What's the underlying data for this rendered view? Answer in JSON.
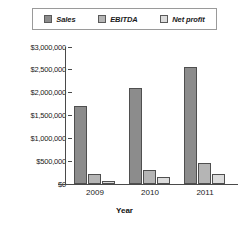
{
  "chart_data": {
    "type": "bar",
    "title": "",
    "xlabel": "Year",
    "ylabel": "",
    "categories": [
      "2009",
      "2010",
      "2011"
    ],
    "series": [
      {
        "name": "Sales",
        "values": [
          1700000,
          2100000,
          2570000
        ],
        "color": "#8c8c8c"
      },
      {
        "name": "EBITDA",
        "values": [
          210000,
          300000,
          450000
        ],
        "color": "#b5b5b5"
      },
      {
        "name": "Net profit",
        "values": [
          60000,
          145000,
          230000
        ],
        "color": "#dcdcdc"
      }
    ],
    "ylim": [
      0,
      3000000
    ],
    "ytick_values": [
      3000000,
      2500000,
      2000000,
      1500000,
      1000000,
      500000,
      0
    ],
    "ytick_labels": [
      "$3,000,000",
      "$2,500,000",
      "$2,000,000",
      "$1,500,000",
      "$1,000,000",
      "$500,000",
      "$0"
    ],
    "grid": false,
    "legend_position": "top"
  },
  "legend": {
    "items": [
      {
        "label": "Sales",
        "swatch_color": "#8c8c8c"
      },
      {
        "label": "EBITDA",
        "swatch_color": "#b5b5b5"
      },
      {
        "label": "Net profit",
        "swatch_color": "#dcdcdc"
      }
    ]
  },
  "axis": {
    "x_title": "Year",
    "x_labels": [
      "2009",
      "2010",
      "2011"
    ],
    "y_labels": [
      "$3,000,000",
      "$2,500,000",
      "$2,000,000",
      "$1,500,000",
      "$1,000,000",
      "$500,000",
      "$0"
    ]
  }
}
